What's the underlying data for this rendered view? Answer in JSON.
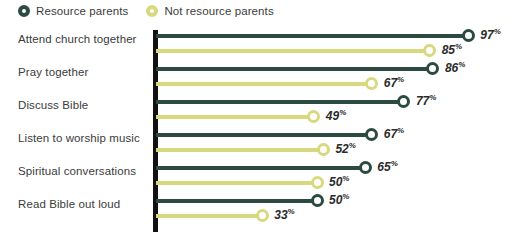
{
  "legend": {
    "items": [
      {
        "label": "Resource parents",
        "color": "#2d4a42",
        "marker": "ring-marker-icon"
      },
      {
        "label": "Not resource parents",
        "color": "#d8d97e",
        "marker": "ring-marker-icon"
      }
    ]
  },
  "chart_data": {
    "type": "bar",
    "title": "",
    "xlabel": "",
    "ylabel": "",
    "xlim": [
      0,
      100
    ],
    "grid": false,
    "legend_position": "top-left",
    "categories": [
      "Attend church together",
      "Pray together",
      "Discuss Bible",
      "Listen to worship music",
      "Spiritual conversations",
      "Read Bible out loud"
    ],
    "series": [
      {
        "name": "Resource parents",
        "color": "#2d4a42",
        "values": [
          97,
          86,
          77,
          67,
          65,
          50
        ],
        "labels": [
          "97",
          "86",
          "77",
          "67",
          "65",
          "50"
        ]
      },
      {
        "name": "Not resource parents",
        "color": "#d8d97e",
        "values": [
          85,
          67,
          49,
          52,
          50,
          33
        ],
        "labels": [
          "85",
          "67",
          "49",
          "52",
          "50",
          "33"
        ]
      }
    ],
    "value_suffix": "%"
  }
}
